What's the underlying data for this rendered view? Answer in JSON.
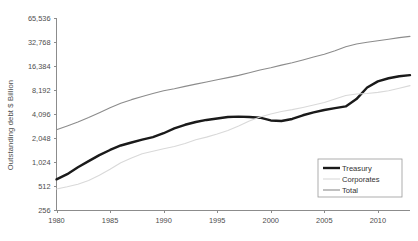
{
  "figure": {
    "background_color": "#ffffff",
    "axis_color": "#8c8c8c",
    "text_color": "#4d4d4d"
  },
  "axis": {
    "ylabel": "Outstanding debt $ Billion",
    "y_ticks": [
      "256",
      "512",
      "1,024",
      "2,048",
      "4,096",
      "8,192",
      "16,384",
      "32,768",
      "65,536"
    ],
    "x_ticks": [
      "1980",
      "1985",
      "1990",
      "1995",
      "2000",
      "2005",
      "2010"
    ]
  },
  "legend": {
    "items": [
      {
        "label": "Treasury",
        "color": "#1a1a1a",
        "width": 2.4
      },
      {
        "label": "Corporates",
        "color": "#d9d9d9",
        "width": 1.1
      },
      {
        "label": "Total",
        "color": "#8c8c8c",
        "width": 1.1
      }
    ]
  },
  "chart_data": {
    "type": "line",
    "title": "",
    "xlabel": "",
    "ylabel": "Outstanding debt $ Billion",
    "yscale": "log2",
    "ylim": [
      256,
      65536
    ],
    "xlim": [
      1980,
      2013
    ],
    "grid": false,
    "legend_position": "bottom-right",
    "x": [
      1980,
      1981,
      1982,
      1983,
      1984,
      1985,
      1986,
      1987,
      1988,
      1989,
      1990,
      1991,
      1992,
      1993,
      1994,
      1995,
      1996,
      1997,
      1998,
      1999,
      2000,
      2001,
      2002,
      2003,
      2004,
      2005,
      2006,
      2007,
      2008,
      2009,
      2010,
      2011,
      2012,
      2013
    ],
    "series": [
      {
        "name": "Treasury",
        "color": "#1a1a1a",
        "width": 2.4,
        "values": [
          620,
          720,
          880,
          1050,
          1250,
          1450,
          1650,
          1800,
          1950,
          2100,
          2350,
          2700,
          3000,
          3250,
          3450,
          3600,
          3750,
          3800,
          3750,
          3680,
          3400,
          3350,
          3550,
          3950,
          4300,
          4600,
          4850,
          5100,
          6300,
          8800,
          10500,
          11500,
          12200,
          12600
        ]
      },
      {
        "name": "Corporates",
        "color": "#d9d9d9",
        "width": 1.1,
        "values": [
          470,
          500,
          540,
          600,
          700,
          830,
          1000,
          1150,
          1300,
          1400,
          1500,
          1600,
          1750,
          1950,
          2100,
          2300,
          2550,
          2900,
          3350,
          3750,
          4100,
          4400,
          4650,
          4950,
          5300,
          5700,
          6300,
          7000,
          7300,
          7400,
          7650,
          8000,
          8600,
          9300
        ]
      },
      {
        "name": "Total",
        "color": "#8c8c8c",
        "width": 1.1,
        "values": [
          2600,
          2900,
          3250,
          3700,
          4250,
          4900,
          5600,
          6200,
          6800,
          7400,
          8000,
          8500,
          9100,
          9700,
          10300,
          11000,
          11700,
          12500,
          13500,
          14600,
          15600,
          16800,
          18000,
          19500,
          21200,
          23000,
          25500,
          28500,
          31000,
          32500,
          34000,
          35500,
          37200,
          38500
        ]
      }
    ]
  }
}
